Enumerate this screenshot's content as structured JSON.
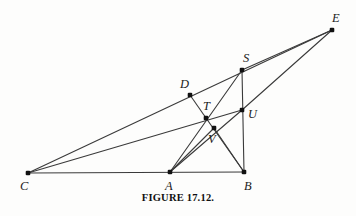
{
  "figure": {
    "caption": "FIGURE 17.12.",
    "width": 356,
    "height": 216,
    "line_color": "#3a3a3a",
    "point_color": "#111111",
    "background_color": "#fdfdfc",
    "label_color": "#1b1b1b"
  },
  "chart_data": {
    "type": "diagram",
    "title": "FIGURE 17.12.",
    "subtype": "euclidean-geometry-construction",
    "xlabel": "",
    "ylabel": "",
    "xlim": [
      0,
      356
    ],
    "ylim": [
      216,
      0
    ],
    "grid": false,
    "legend": "none",
    "points": [
      {
        "name": "C",
        "x": 28,
        "y": 173,
        "label": "C",
        "label_x": 20,
        "label_y": 180
      },
      {
        "name": "A",
        "x": 170,
        "y": 172,
        "label": "A",
        "label_x": 165,
        "label_y": 180
      },
      {
        "name": "B",
        "x": 244,
        "y": 172,
        "label": "B",
        "label_x": 244,
        "label_y": 180
      },
      {
        "name": "E",
        "x": 332,
        "y": 30,
        "label": "E",
        "label_x": 332,
        "label_y": 12
      },
      {
        "name": "S",
        "x": 242,
        "y": 70,
        "label": "S",
        "label_x": 243,
        "label_y": 52
      },
      {
        "name": "D",
        "x": 190,
        "y": 95,
        "label": "D",
        "label_x": 180,
        "label_y": 78
      },
      {
        "name": "T",
        "x": 206,
        "y": 118,
        "label": "T",
        "label_x": 203,
        "label_y": 100
      },
      {
        "name": "U",
        "x": 242,
        "y": 110,
        "label": "U",
        "label_x": 248,
        "label_y": 108
      },
      {
        "name": "V",
        "x": 214,
        "y": 128,
        "label": "V",
        "label_x": 208,
        "label_y": 133
      }
    ],
    "segments": [
      {
        "name": "C-B-baseline",
        "from": "C",
        "to": "B"
      },
      {
        "name": "C-E",
        "from": "C",
        "to": "E"
      },
      {
        "name": "C-U",
        "from": "C",
        "to": "U"
      },
      {
        "name": "S-E",
        "from": "S",
        "to": "E"
      },
      {
        "name": "U-E",
        "from": "U",
        "to": "E"
      },
      {
        "name": "S-B",
        "from": "S",
        "to": "B"
      },
      {
        "name": "A-S",
        "from": "A",
        "to": "S"
      },
      {
        "name": "A-U",
        "from": "A",
        "to": "U"
      },
      {
        "name": "D-T",
        "from": "D",
        "to": "T"
      },
      {
        "name": "T-B",
        "from": "T",
        "to": "B"
      },
      {
        "name": "A-V",
        "from": "A",
        "to": "V"
      },
      {
        "name": "V-B",
        "from": "V",
        "to": "B"
      }
    ],
    "annotations": [
      "D lies on segment C-E",
      "T lies on segment C-U and on segment A-S",
      "U lies on segment S-B",
      "V lies on segment T-B and on segment A-U"
    ]
  }
}
